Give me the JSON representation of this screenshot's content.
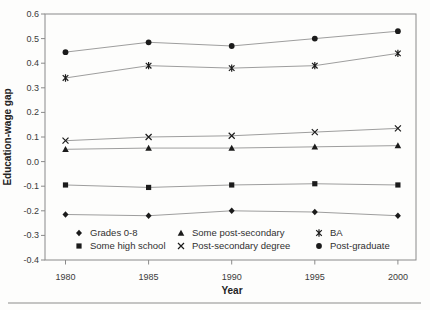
{
  "chart_data": {
    "type": "line",
    "x": [
      1980,
      1985,
      1990,
      1995,
      2000
    ],
    "x_tick_labels": [
      "1980",
      "1985",
      "1990",
      "1995",
      "2000"
    ],
    "xlabel": "Year",
    "ylabel": "Education-wage gap",
    "ylim": [
      -0.4,
      0.6
    ],
    "y_ticks": [
      0.6,
      0.5,
      0.4,
      0.3,
      0.2,
      0.1,
      0.0,
      -0.1,
      -0.2,
      -0.3,
      -0.4
    ],
    "y_tick_labels": [
      "0.6",
      "0.5",
      "0.4",
      "0.3",
      "0.2",
      "0.1",
      "0.0",
      "-0.1",
      "-0.2",
      "-0.3",
      "-0.4"
    ],
    "grid": false,
    "legend_position": "inside-bottom",
    "series": [
      {
        "name": "Grades 0-8",
        "marker": "diamond",
        "values": [
          -0.215,
          -0.22,
          -0.2,
          -0.205,
          -0.22
        ]
      },
      {
        "name": "Some high school",
        "marker": "square",
        "values": [
          -0.095,
          -0.105,
          -0.095,
          -0.09,
          -0.095
        ]
      },
      {
        "name": "Some post-secondary",
        "marker": "triangle",
        "values": [
          0.05,
          0.055,
          0.055,
          0.06,
          0.065
        ]
      },
      {
        "name": "Post-secondary degree",
        "marker": "x",
        "values": [
          0.085,
          0.1,
          0.105,
          0.12,
          0.135
        ]
      },
      {
        "name": "BA",
        "marker": "asterisk",
        "values": [
          0.34,
          0.39,
          0.38,
          0.39,
          0.44
        ]
      },
      {
        "name": "Post-graduate",
        "marker": "circle",
        "values": [
          0.445,
          0.485,
          0.47,
          0.5,
          0.53
        ]
      }
    ]
  },
  "colors": {
    "line": "#9e9e9e",
    "marker": "#1b1b1b",
    "frame": "#8a8a8a",
    "tick_text": "#3b3b3b",
    "rule": "#b0b0b0",
    "background": "#fdfdfc"
  }
}
